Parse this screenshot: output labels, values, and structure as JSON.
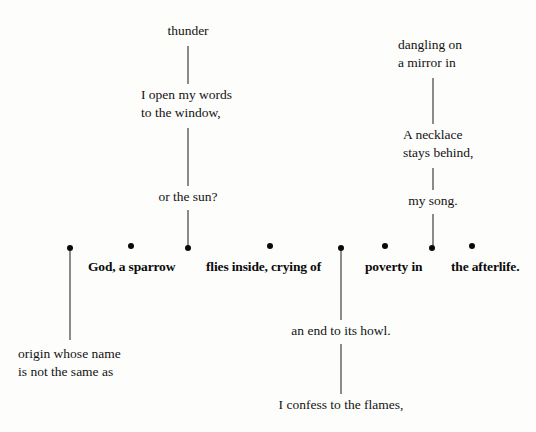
{
  "page": {
    "background_color": "#fdfdfc",
    "ink_color": "#0b0b0b",
    "width": 536,
    "height": 432
  },
  "spine": {
    "nodes": [
      {
        "id": "node-1",
        "x": 70,
        "y": 248,
        "has_label": false
      },
      {
        "id": "node-2",
        "x": 131,
        "y": 246,
        "has_label": true,
        "label": "God, a sparrow"
      },
      {
        "id": "node-3",
        "x": 188,
        "y": 248,
        "has_label": false
      },
      {
        "id": "node-4",
        "x": 270,
        "y": 246,
        "has_label": true,
        "label": "flies inside, crying of"
      },
      {
        "id": "node-5",
        "x": 341,
        "y": 248,
        "has_label": false
      },
      {
        "id": "node-6",
        "x": 385,
        "y": 246,
        "has_label": true,
        "label": "poverty in"
      },
      {
        "id": "node-7",
        "x": 432,
        "y": 248,
        "has_label": false
      },
      {
        "id": "node-8",
        "x": 472,
        "y": 246,
        "has_label": true,
        "label": "the afterlife."
      }
    ],
    "labels": {
      "god_a_sparrow": "God, a sparrow",
      "flies_inside": "flies inside, crying of",
      "poverty_in": "poverty in",
      "the_afterlife": "the afterlife."
    }
  },
  "branches": {
    "upper_left": {
      "stem_x": 188,
      "top_text": "thunder",
      "middle_text": "I open my words\nto the window,",
      "bottom_text": "or the sun?"
    },
    "upper_right": {
      "stem_x": 433,
      "top_text": "dangling on\na mirror in",
      "middle_text": "A necklace\nstays behind,",
      "bottom_text": "my song."
    },
    "lower_left": {
      "stem_x": 70,
      "text": "origin whose name\nis not the same as"
    },
    "lower_center": {
      "stem_x": 341,
      "upper_text": "an end to its howl.",
      "lower_text": "I confess to the flames,"
    }
  }
}
